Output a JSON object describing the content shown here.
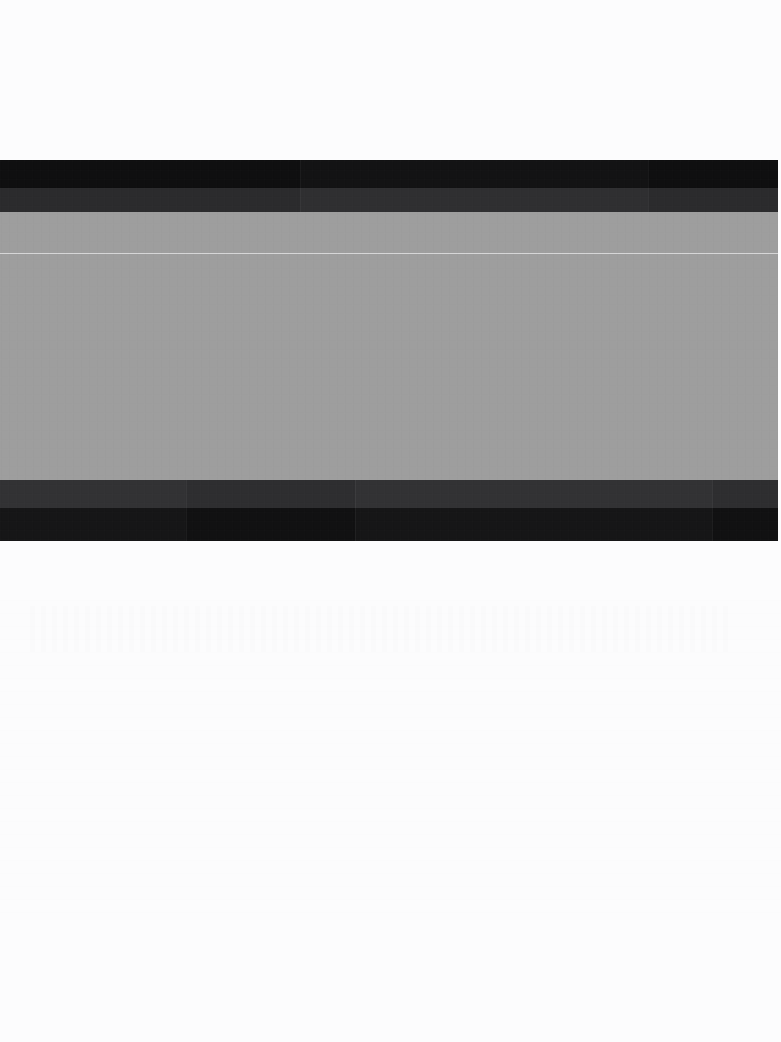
{
  "image": {
    "description": "Heavily degraded / blurred computer-use screenshot. No text is legible at any zoom level; the only discernible structure is a wide horizontal panel with dark header bands, a mid-gray body area containing one thin light divider line, and dark footer bands, set on a near-white page.",
    "width": 781,
    "height": 1042,
    "legible_text": "none",
    "background_color": "#fcfcfd"
  },
  "panel": {
    "name": "horizontal-panel",
    "left": 0,
    "top": 160,
    "width": 778,
    "height": 381,
    "body_color": "#9e9e9e"
  },
  "bands": [
    {
      "name": "header-band-primary",
      "role": "title-bar",
      "top": 0,
      "height": 28,
      "color": "#0f0f10"
    },
    {
      "name": "header-band-secondary",
      "role": "toolbar",
      "top": 28,
      "height": 24,
      "color": "#2b2b2d"
    },
    {
      "name": "body-region",
      "role": "content-area",
      "top": 52,
      "height": 268,
      "color": "#9e9e9e"
    },
    {
      "name": "footer-band-secondary",
      "role": "footer-upper",
      "top": 320,
      "height": 28,
      "color": "#2e2e30"
    },
    {
      "name": "footer-band-primary",
      "role": "footer-lower",
      "top": 348,
      "height": 33,
      "color": "#111112"
    }
  ],
  "divider": {
    "name": "body-divider",
    "offset_top_in_panel": 93,
    "absolute_y": 253,
    "color": "#d9d9da",
    "thickness": 1
  },
  "segments": {
    "footer_seam_x": [
      186,
      355,
      712
    ],
    "header_seam_x": [
      300,
      648
    ],
    "note": "Faint vertical tonal seams suggesting column/section boundaries within the dark bands."
  },
  "lower_page": {
    "name": "lower-blank-region",
    "top": 541,
    "height": 501,
    "content": "blank white with faint compression ghosting only"
  }
}
